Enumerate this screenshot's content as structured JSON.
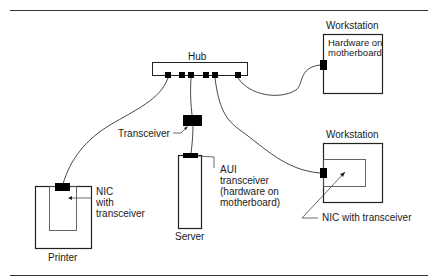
{
  "diagram": {
    "nodes": {
      "hub": {
        "label": "Hub"
      },
      "workstation_top": {
        "label": "Workstation",
        "inner_label": [
          "Hardware on",
          "motherboard"
        ]
      },
      "workstation_bottom": {
        "label": "Workstation"
      },
      "server": {
        "label": "Server"
      },
      "printer": {
        "label": "Printer"
      },
      "transceiver": {
        "label": "Transceiver"
      }
    },
    "annotations": {
      "aui": [
        "AUI",
        "transceiver",
        "(hardware on",
        "motherboard)"
      ],
      "printer_nic": [
        "NIC",
        "with",
        "transceiver"
      ],
      "workstation_nic": "NIC with transceiver"
    },
    "edges": [
      {
        "from": "hub",
        "to": "printer"
      },
      {
        "from": "hub",
        "to": "transceiver"
      },
      {
        "from": "transceiver",
        "to": "server"
      },
      {
        "from": "hub",
        "to": "workstation_bottom"
      },
      {
        "from": "hub",
        "to": "workstation_top"
      }
    ],
    "colors": {
      "line": "#1a1a1a",
      "fill": "#000000",
      "background": "#ffffff"
    }
  }
}
